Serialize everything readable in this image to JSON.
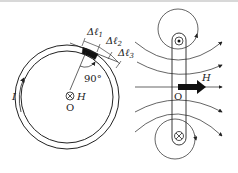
{
  "figure": {
    "left_panel": {
      "description": "Ring core cross-section with current I and magnetic field H into the page at center O",
      "labels": {
        "delta_l1": "Δℓ",
        "delta_l1_sub": "1",
        "delta_l2": "Δℓ",
        "delta_l2_sub": "2",
        "delta_l3": "Δℓ",
        "delta_l3_sub": "3",
        "angle": "90°",
        "current": "I",
        "field": "H",
        "center": "O"
      }
    },
    "right_panel": {
      "description": "Side view of the loop: current out of page (top) and into page (bottom), field lines passing through, field H at center",
      "labels": {
        "field": "H",
        "center": "O"
      }
    },
    "colors": {
      "stroke": "#222222",
      "fill_dark": "#111111",
      "background": "#ffffff"
    }
  }
}
